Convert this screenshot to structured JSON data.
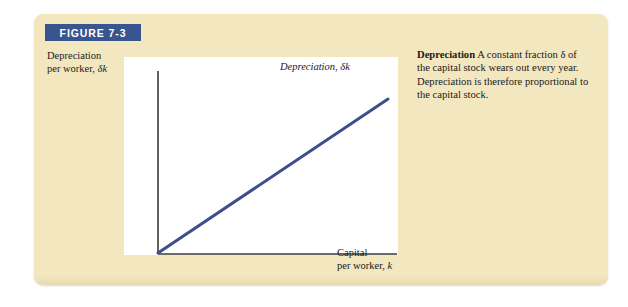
{
  "figure": {
    "banner_label": "FIGURE 7-3",
    "caption_title": "Depreciation",
    "caption_body": " A constant fraction δ of the capital stock wears out every year. Depreciation is therefore proportional to the capital stock."
  },
  "chart_data": {
    "type": "line",
    "title": "",
    "xlabel": "Capital\nper worker, k",
    "ylabel": "Depreciation\nper worker, δk",
    "series": [
      {
        "name": "Depreciation, δk",
        "x": [
          0,
          1
        ],
        "values": [
          0,
          1
        ],
        "color": "#3b4f8a",
        "label": "Depreciation, δk",
        "relationship": "linear through origin, slope δ"
      }
    ],
    "xlim": [
      0,
      1
    ],
    "ylim": [
      0,
      1
    ],
    "grid": false,
    "ticks": false,
    "legend": "inline-label-above-line",
    "axis_color": "#3d3a33",
    "plot_background": "#ffffff"
  },
  "colors": {
    "card_background": "#f3e7bf",
    "banner": "#39558f",
    "line": "#3b4f8a",
    "text": "#1a1a1a"
  }
}
